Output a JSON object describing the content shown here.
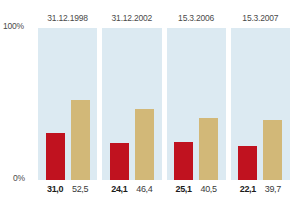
{
  "chart_data": {
    "type": "bar",
    "title": "",
    "xlabel": "",
    "ylabel": "",
    "ylim": [
      0,
      100
    ],
    "grid": false,
    "legend": "none",
    "categories": [
      "31.12.1998",
      "31.12.2002",
      "15.3.2006",
      "15.3.2007"
    ],
    "axis": {
      "top_tick_label": "100%",
      "bottom_tick_label": "0%"
    },
    "series": [
      {
        "name": "red-series",
        "color": "#c0121f",
        "values": [
          31.0,
          24.1,
          25.1,
          22.1
        ],
        "value_labels": [
          "31,0",
          "24,1",
          "25,1",
          "22,1"
        ]
      },
      {
        "name": "beige-series",
        "color": "#d2b878",
        "values": [
          52.5,
          46.4,
          40.5,
          39.7
        ],
        "value_labels": [
          "52,5",
          "46,4",
          "40,5",
          "39,7"
        ]
      }
    ],
    "panel_background_color": "#dceaf2"
  },
  "panels": [
    {
      "date": "31.12.1998",
      "red_label": "31,0",
      "beige_label": "52,5",
      "red_pct": 31.0,
      "beige_pct": 52.5
    },
    {
      "date": "31.12.2002",
      "red_label": "24,1",
      "beige_label": "46,4",
      "red_pct": 24.1,
      "beige_pct": 46.4
    },
    {
      "date": "15.3.2006",
      "red_label": "25,1",
      "beige_label": "40,5",
      "red_pct": 25.1,
      "beige_pct": 40.5
    },
    {
      "date": "15.3.2007",
      "red_label": "22,1",
      "beige_label": "39,7",
      "red_pct": 22.1,
      "beige_pct": 39.7
    }
  ]
}
